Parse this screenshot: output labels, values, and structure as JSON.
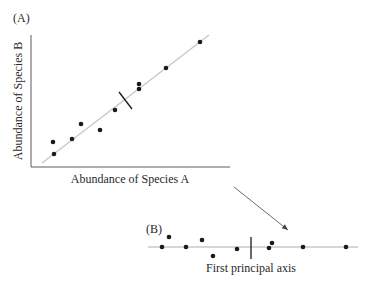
{
  "panel_a": {
    "label": "(A)",
    "xlabel": "Abundance of Species A",
    "ylabel": "Abundance of Species B",
    "points": [
      [
        53,
        142
      ],
      [
        54,
        154
      ],
      [
        72,
        139
      ],
      [
        81,
        124
      ],
      [
        100,
        130
      ],
      [
        115,
        110
      ],
      [
        139,
        84
      ],
      [
        139,
        89
      ],
      [
        166,
        68
      ],
      [
        200,
        42
      ]
    ],
    "fit_line": [
      [
        42,
        163
      ],
      [
        209,
        35
      ]
    ],
    "tick": [
      [
        119,
        92
      ],
      [
        132,
        109
      ]
    ]
  },
  "panel_b": {
    "label": "(B)",
    "axis_label": "First principal axis",
    "points": [
      [
        162,
        247
      ],
      [
        169,
        237
      ],
      [
        186,
        247
      ],
      [
        202,
        240
      ],
      [
        213,
        256
      ],
      [
        237,
        249
      ],
      [
        269,
        248
      ],
      [
        272,
        243
      ],
      [
        303,
        247
      ],
      [
        346,
        247
      ]
    ],
    "axis_line": [
      [
        148,
        247
      ],
      [
        358,
        247
      ]
    ],
    "tick": [
      [
        251,
        237
      ],
      [
        251,
        259
      ]
    ]
  },
  "arrow": [
    [
      234,
      187
    ],
    [
      288,
      230
    ]
  ],
  "colors": {
    "line": "#c8c8c8",
    "point": "#1a1a1a",
    "text": "#2a2a2a"
  },
  "chart_data": [
    {
      "type": "scatter",
      "title": "(A)",
      "xlabel": "Abundance of Species A",
      "ylabel": "Abundance of Species B",
      "x": [
        0.07,
        0.07,
        0.16,
        0.21,
        0.31,
        0.39,
        0.52,
        0.52,
        0.66,
        0.85
      ],
      "y": [
        0.2,
        0.1,
        0.22,
        0.34,
        0.29,
        0.45,
        0.66,
        0.62,
        0.79,
        1.0
      ],
      "annotations": [
        "regression/principal axis line",
        "centroid tick mark"
      ],
      "grid": false
    },
    {
      "type": "scatter",
      "title": "(B)",
      "xlabel": "First principal axis",
      "x": [
        0.07,
        0.1,
        0.19,
        0.27,
        0.33,
        0.45,
        0.61,
        0.63,
        0.78,
        1.0
      ],
      "y": [
        0,
        0.05,
        0,
        0.04,
        -0.05,
        -0.01,
        0,
        0.02,
        0,
        0
      ],
      "grid": false
    }
  ]
}
